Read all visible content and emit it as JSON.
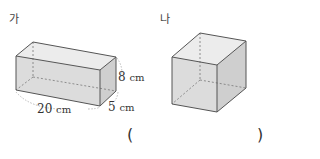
{
  "figures": [
    {
      "id": "ga",
      "label": "가",
      "shape": "rectangular-prism",
      "dimensions": {
        "length": {
          "value": "20",
          "unit": "cm"
        },
        "height": {
          "value": "8",
          "unit": "cm"
        },
        "depth": {
          "value": "5",
          "unit": "cm"
        }
      }
    },
    {
      "id": "na",
      "label": "나",
      "shape": "cube"
    }
  ],
  "answer": {
    "open": "(",
    "close": ")"
  },
  "colors": {
    "face_fill": "#d9d9d9",
    "edge": "#555555",
    "hidden_edge": "#777777",
    "dim_arc": "#aaaaaa"
  }
}
